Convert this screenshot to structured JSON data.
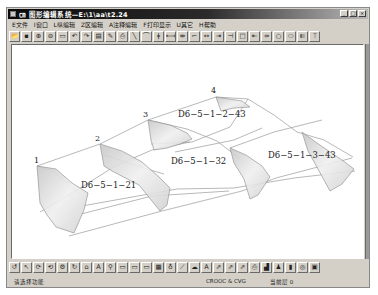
{
  "window": {
    "title": "㎝ 图形编辑系统—E:\\1\\aa\\t2.24",
    "controls": [
      "_",
      "□",
      "×"
    ]
  },
  "menu": {
    "items": [
      "E文件",
      "I窗口",
      "L纵编辑",
      "Z区编辑",
      "A注释编辑",
      "F打印显示",
      "U其它",
      "H帮助"
    ]
  },
  "toolbar_top": {
    "icons": [
      {
        "name": "open-icon",
        "glyph": "📂"
      },
      {
        "name": "save-icon",
        "glyph": "▪"
      },
      {
        "name": "zoom-in-icon",
        "glyph": "⊕"
      },
      {
        "name": "zoom-out-icon",
        "glyph": "⊖"
      },
      {
        "name": "rectangle-select-icon",
        "glyph": "▭"
      },
      {
        "name": "undo-icon",
        "glyph": "↶"
      },
      {
        "name": "redo-icon",
        "glyph": "↷"
      },
      {
        "name": "layers-icon",
        "glyph": "▤"
      },
      {
        "name": "edit-icon",
        "glyph": "✎"
      },
      {
        "name": "print-icon",
        "glyph": "⎙"
      },
      {
        "name": "line-icon",
        "glyph": "╲"
      },
      {
        "name": "arc-icon",
        "glyph": "⌒"
      },
      {
        "name": "break-icon",
        "glyph": "ǂ"
      },
      {
        "name": "extend-left-icon",
        "glyph": "⟻"
      },
      {
        "name": "trim-icon",
        "glyph": "⇹"
      },
      {
        "name": "wrench-icon",
        "glyph": "⌐"
      },
      {
        "name": "dimension-icon",
        "glyph": "↔"
      },
      {
        "name": "align-icon",
        "glyph": "⇥"
      },
      {
        "name": "move-point-icon",
        "glyph": "⊣"
      },
      {
        "name": "square-icon",
        "glyph": "□"
      },
      {
        "name": "connect-icon",
        "glyph": "⇤"
      },
      {
        "name": "join-icon",
        "glyph": "⇸"
      },
      {
        "name": "circle-icon",
        "glyph": "○"
      },
      {
        "name": "ellipse-icon",
        "glyph": "⬭"
      },
      {
        "name": "back-icon",
        "glyph": "⇇"
      },
      {
        "name": "pin-icon",
        "glyph": "⍡"
      }
    ]
  },
  "toolbar_bottom": {
    "icons": [
      {
        "name": "rotate-left-icon",
        "glyph": "↺"
      },
      {
        "name": "pointer-icon",
        "glyph": "↖"
      },
      {
        "name": "refresh-icon",
        "glyph": "⟳"
      },
      {
        "name": "refresh-all-icon",
        "glyph": "⟲"
      },
      {
        "name": "cycle-icon",
        "glyph": "⚙"
      },
      {
        "name": "recalc-icon",
        "glyph": "↻"
      },
      {
        "name": "shape-icon",
        "glyph": "⌂"
      },
      {
        "name": "text-icon",
        "glyph": "A"
      },
      {
        "name": "find-icon",
        "glyph": "⚲"
      },
      {
        "name": "table-icon",
        "glyph": "▭"
      },
      {
        "name": "table2-icon",
        "glyph": "▭"
      },
      {
        "name": "table3-icon",
        "glyph": "▭"
      },
      {
        "name": "grid-icon",
        "glyph": "▦"
      },
      {
        "name": "bulb-icon",
        "glyph": "♁"
      },
      {
        "name": "pen-icon",
        "glyph": "⟋"
      },
      {
        "name": "cloud-icon",
        "glyph": "☁"
      },
      {
        "name": "label-icon",
        "glyph": "A"
      },
      {
        "name": "export-icon",
        "glyph": "⇗"
      },
      {
        "name": "export2-icon",
        "glyph": "⇗"
      },
      {
        "name": "export3-icon",
        "glyph": "⇗"
      },
      {
        "name": "printer-icon",
        "glyph": "⎙"
      },
      {
        "name": "chart-icon",
        "glyph": "▟"
      },
      {
        "name": "person-icon",
        "glyph": "♟"
      },
      {
        "name": "document-icon",
        "glyph": "▮"
      },
      {
        "name": "target-icon",
        "glyph": "◎"
      },
      {
        "name": "settings-icon",
        "glyph": "▣"
      }
    ]
  },
  "canvas": {
    "point_labels": [
      {
        "text": "1",
        "x": 22,
        "y": 118
      },
      {
        "text": "2",
        "x": 83,
        "y": 96
      },
      {
        "text": "3",
        "x": 131,
        "y": 72
      },
      {
        "text": "4",
        "x": 199,
        "y": 48
      }
    ],
    "section_labels": [
      {
        "text": "D6−5−1−21",
        "x": 69,
        "y": 143
      },
      {
        "text": "D6−5−1−2−43",
        "x": 166,
        "y": 72
      },
      {
        "text": "D6−5−1−32",
        "x": 159,
        "y": 119
      },
      {
        "text": "D6−5−1−3−43",
        "x": 256,
        "y": 113
      }
    ]
  },
  "status": {
    "left": "请选择功能",
    "middle": "CROOC & CVG",
    "right": "当前层 0"
  }
}
